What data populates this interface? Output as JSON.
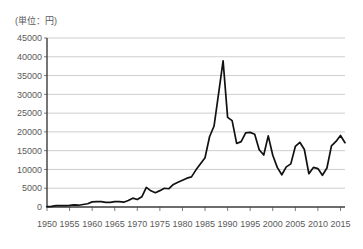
{
  "chart_data": {
    "type": "line",
    "title": "",
    "subtitle": "",
    "unit_label": "(単位：円)",
    "xlabel": "",
    "ylabel": "",
    "xlim": [
      1950,
      2016
    ],
    "ylim": [
      0,
      45000
    ],
    "grid": true,
    "legend": "none",
    "y_ticks": [
      0,
      5000,
      10000,
      15000,
      20000,
      25000,
      30000,
      35000,
      40000,
      45000
    ],
    "y_tick_labels": [
      "0",
      "5000",
      "10000",
      "15000",
      "20000",
      "25000",
      "30000",
      "35000",
      "40000",
      "45000"
    ],
    "x_ticks": [
      1950,
      1955,
      1960,
      1965,
      1970,
      1975,
      1980,
      1985,
      1990,
      1995,
      2000,
      2005,
      2010,
      2015
    ],
    "x_tick_labels": [
      "1950",
      "1955",
      "1960",
      "1965",
      "1970",
      "1975",
      "1980",
      "1985",
      "1990",
      "1995",
      "2000",
      "2005",
      "2010",
      "2015"
    ],
    "series": [
      {
        "name": "日経平均株価",
        "color": "#111111",
        "x": [
          1950,
          1951,
          1952,
          1953,
          1954,
          1955,
          1956,
          1957,
          1958,
          1959,
          1960,
          1961,
          1962,
          1963,
          1964,
          1965,
          1966,
          1967,
          1968,
          1969,
          1970,
          1971,
          1972,
          1973,
          1974,
          1975,
          1976,
          1977,
          1978,
          1979,
          1980,
          1981,
          1982,
          1983,
          1984,
          1985,
          1986,
          1987,
          1988,
          1989,
          1990,
          1991,
          1992,
          1993,
          1994,
          1995,
          1996,
          1997,
          1998,
          1999,
          2000,
          2001,
          2002,
          2003,
          2004,
          2005,
          2006,
          2007,
          2008,
          2009,
          2010,
          2011,
          2012,
          2013,
          2014,
          2015,
          2016
        ],
        "values": [
          110,
          170,
          360,
          378,
          356,
          425,
          549,
          475,
          666,
          874,
          1357,
          1432,
          1420,
          1225,
          1216,
          1418,
          1453,
          1284,
          1714,
          2359,
          1987,
          2714,
          5208,
          4307,
          3817,
          4359,
          4991,
          4866,
          6002,
          6569,
          7116,
          7682,
          8017,
          9894,
          11543,
          13113,
          18701,
          21564,
          30159,
          38916,
          23849,
          22984,
          16925,
          17417,
          19723,
          19868,
          19361,
          15259,
          13842,
          18934,
          13786,
          10543,
          8579,
          10677,
          11489,
          16111,
          17226,
          15308,
          8860,
          10546,
          10229,
          8455,
          10395,
          16291,
          17451,
          19034,
          17113
        ]
      }
    ]
  },
  "axes": {
    "y_title": "",
    "x_title": ""
  }
}
